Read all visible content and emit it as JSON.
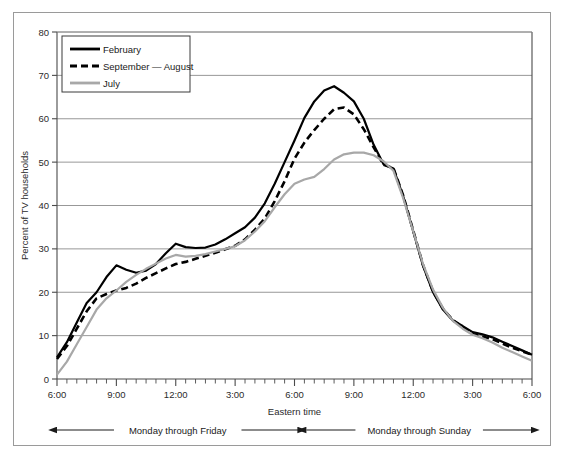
{
  "chart_data": {
    "type": "line",
    "title": "",
    "xlabel": "Eastern time",
    "ylabel": "Percent of TV households",
    "ylim": [
      0,
      80
    ],
    "ytick_step": 10,
    "yticks": [
      0,
      10,
      20,
      30,
      40,
      50,
      60,
      70,
      80
    ],
    "grid": "horizontal",
    "legend_position": "top-left-inside",
    "xlim_hours": [
      6,
      30
    ],
    "xtick_labels": [
      "6:00",
      "9:00",
      "12:00",
      "3:00",
      "6:00",
      "9:00",
      "12:00",
      "3:00",
      "6:00"
    ],
    "xtick_hours": [
      6,
      9,
      12,
      15,
      18,
      21,
      24,
      27,
      30
    ],
    "minor_tick_interval_hours": 0.5,
    "x": [
      6,
      6.5,
      7,
      7.5,
      8,
      8.5,
      9,
      9.5,
      10,
      10.5,
      11,
      11.5,
      12,
      12.5,
      13,
      13.5,
      14,
      14.5,
      15,
      15.5,
      16,
      16.5,
      17,
      17.5,
      18,
      18.5,
      19,
      19.5,
      20,
      20.5,
      21,
      21.5,
      22,
      22.5,
      23,
      23.5,
      24,
      24.5,
      25,
      25.5,
      26,
      26.5,
      27,
      27.5,
      28,
      28.5,
      29,
      29.5,
      30
    ],
    "series": [
      {
        "name": "February",
        "style": "solid",
        "color": "#000000",
        "width": 2.2,
        "values": [
          5.0,
          8.5,
          13.0,
          17.5,
          20.0,
          23.5,
          26.2,
          25.2,
          24.5,
          25.0,
          26.5,
          29.0,
          31.2,
          30.4,
          30.2,
          30.3,
          31.0,
          32.2,
          33.6,
          35.0,
          37.2,
          40.5,
          45.0,
          50.0,
          55.0,
          60.2,
          64.0,
          66.5,
          67.5,
          66.0,
          64.0,
          60.0,
          54.0,
          49.5,
          48.5,
          42.0,
          34.0,
          26.0,
          20.0,
          16.0,
          13.5,
          12.2,
          10.8,
          10.3,
          9.6,
          8.6,
          7.6,
          6.6,
          5.6
        ]
      },
      {
        "name": "September — August",
        "style": "dashed",
        "color": "#000000",
        "width": 2.6,
        "values": [
          4.6,
          7.6,
          11.6,
          15.6,
          18.6,
          19.6,
          20.4,
          21.0,
          22.0,
          23.3,
          24.4,
          25.5,
          26.5,
          27.0,
          27.7,
          28.4,
          29.1,
          29.9,
          30.7,
          32.2,
          34.4,
          37.0,
          41.0,
          45.6,
          50.8,
          54.5,
          57.4,
          60.0,
          62.2,
          62.6,
          61.0,
          57.6,
          53.4,
          49.4,
          48.6,
          42.2,
          34.2,
          26.2,
          20.2,
          16.2,
          13.6,
          12.0,
          10.4,
          9.8,
          9.2,
          8.2,
          7.2,
          6.4,
          5.6
        ]
      },
      {
        "name": "July",
        "style": "solid",
        "color": "#a8a8a8",
        "width": 2.2,
        "values": [
          1.0,
          4.0,
          8.0,
          12.0,
          16.0,
          18.6,
          20.4,
          22.4,
          24.0,
          25.4,
          26.6,
          27.8,
          28.6,
          28.2,
          28.4,
          28.8,
          29.4,
          30.0,
          30.6,
          32.0,
          34.0,
          36.4,
          39.6,
          42.6,
          45.0,
          46.0,
          46.6,
          48.4,
          50.6,
          51.8,
          52.2,
          52.2,
          51.6,
          50.2,
          48.0,
          41.6,
          34.0,
          26.4,
          20.6,
          16.4,
          13.4,
          11.6,
          10.2,
          9.4,
          8.4,
          7.2,
          6.2,
          5.2,
          4.2
        ]
      }
    ],
    "annotations": [
      {
        "label": "Monday through Friday",
        "start_hour": 6,
        "end_hour": 18.2
      },
      {
        "label": "Monday through Sunday",
        "start_hour": 18.6,
        "end_hour": 30
      }
    ]
  }
}
